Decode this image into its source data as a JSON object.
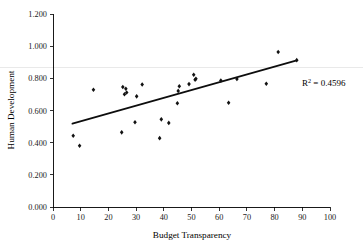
{
  "chart_data": {
    "type": "scatter",
    "title": "",
    "xlabel": "Budget Transparency",
    "ylabel": "Human Development",
    "xlim": [
      0,
      100
    ],
    "ylim": [
      0.0,
      1.2
    ],
    "xticks": [
      "0",
      "10",
      "20",
      "30",
      "40",
      "50",
      "60",
      "70",
      "80",
      "90",
      "100"
    ],
    "yticks": [
      "0.000",
      "0.200",
      "0.400",
      "0.600",
      "0.800",
      "1.000",
      "1.200"
    ],
    "xtick_values": [
      0,
      10,
      20,
      30,
      40,
      50,
      60,
      70,
      80,
      90,
      100
    ],
    "ytick_values": [
      0.0,
      0.2,
      0.4,
      0.6,
      0.8,
      1.0,
      1.2
    ],
    "grid": false,
    "legend": null,
    "marker": "diamond",
    "marker_color": "#121212",
    "annotation": "R² = 0.4596",
    "annotation_base": "R",
    "annotation_sup": "2",
    "annotation_rest": " = 0.4596",
    "r_squared": 0.4596,
    "trendline": {
      "type": "linear",
      "x_start": 7.0,
      "y_start": 0.518,
      "x_end": 88.0,
      "y_end": 0.912,
      "slope": 0.004864,
      "intercept": 0.484
    },
    "points": [
      {
        "x": 7.3,
        "y": 0.443
      },
      {
        "x": 9.6,
        "y": 0.381
      },
      {
        "x": 14.6,
        "y": 0.729
      },
      {
        "x": 24.8,
        "y": 0.464
      },
      {
        "x": 25.2,
        "y": 0.746
      },
      {
        "x": 25.8,
        "y": 0.701
      },
      {
        "x": 26.3,
        "y": 0.735
      },
      {
        "x": 26.6,
        "y": 0.712
      },
      {
        "x": 29.6,
        "y": 0.527
      },
      {
        "x": 30.2,
        "y": 0.688
      },
      {
        "x": 32.2,
        "y": 0.762
      },
      {
        "x": 38.5,
        "y": 0.428
      },
      {
        "x": 39.1,
        "y": 0.545
      },
      {
        "x": 41.8,
        "y": 0.523
      },
      {
        "x": 44.9,
        "y": 0.645
      },
      {
        "x": 45.2,
        "y": 0.722
      },
      {
        "x": 45.6,
        "y": 0.751
      },
      {
        "x": 49.1,
        "y": 0.764
      },
      {
        "x": 50.8,
        "y": 0.822
      },
      {
        "x": 51.3,
        "y": 0.791
      },
      {
        "x": 51.6,
        "y": 0.797
      },
      {
        "x": 60.6,
        "y": 0.786
      },
      {
        "x": 63.4,
        "y": 0.648
      },
      {
        "x": 66.4,
        "y": 0.796
      },
      {
        "x": 77.0,
        "y": 0.766
      },
      {
        "x": 81.3,
        "y": 0.964
      },
      {
        "x": 88.0,
        "y": 0.913
      }
    ]
  },
  "layout": {
    "plot_left": 53,
    "plot_right": 330,
    "plot_top": 14,
    "plot_bottom": 207,
    "artifact_line_y": 0.868
  }
}
